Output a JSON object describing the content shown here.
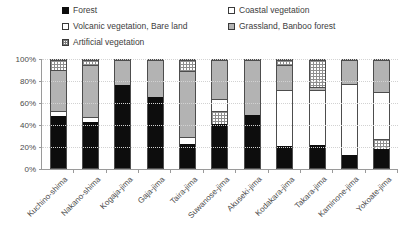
{
  "legend": {
    "left_items": [
      {
        "label": "Forest",
        "key": "forest",
        "color": "#0d0d0d"
      },
      {
        "label": "Volcanic vegetation, Bare land",
        "key": "volcanic",
        "color": "#ffffff"
      },
      {
        "label": "Artificial vegetation",
        "key": "artificial",
        "color": "#ffffff"
      }
    ],
    "right_items": [
      {
        "label": "Coastal vegetation",
        "key": "coastal",
        "color": "#ffffff"
      },
      {
        "label": "Grassland, Banboo forest",
        "key": "grassland",
        "color": "#b3b3b3"
      }
    ]
  },
  "axis": {
    "y_ticks": [
      "0%",
      "20%",
      "40%",
      "60%",
      "80%",
      "100%"
    ]
  },
  "chart_data": {
    "type": "bar",
    "title": "",
    "subtitle": "",
    "xlabel": "",
    "ylabel": "",
    "ylim": [
      0,
      100
    ],
    "ytick_labels": [
      "0%",
      "20%",
      "40%",
      "60%",
      "80%",
      "100%"
    ],
    "ytick_values": [
      0,
      20,
      40,
      60,
      80,
      100
    ],
    "grid": true,
    "stacked": true,
    "normalized_percent": true,
    "legend_position": "top",
    "categories": [
      "Kuchino-shima",
      "Nakano-shima",
      "Kogaja-jima",
      "Gaja-jima",
      "Taira-jima",
      "Suwanose-jima",
      "Akuseki-jima",
      "Kodakara-jima",
      "Takara-jima",
      "Kaminone-jima",
      "Yokoate-jima"
    ],
    "series": [
      {
        "name": "Forest",
        "color": "#0d0d0d",
        "pattern": "solid-black",
        "values": [
          48,
          43,
          77,
          66,
          22,
          41,
          49,
          20,
          21,
          12,
          18
        ]
      },
      {
        "name": "Volcanic vegetation, Bare land",
        "color": "#ffffff",
        "pattern": "white",
        "values": [
          0,
          0,
          0,
          0,
          0,
          0,
          0,
          0,
          0,
          0,
          0
        ]
      },
      {
        "name": "Artificial vegetation",
        "color": "#ffffff",
        "pattern": "fine-grid",
        "values": [
          0,
          0,
          0,
          0,
          0,
          12,
          0,
          0,
          0,
          0,
          9
        ]
      },
      {
        "name": "Coastal vegetation",
        "color": "#ffffff",
        "pattern": "white",
        "values": [
          5,
          4,
          0,
          0,
          7,
          11,
          0,
          52,
          51,
          66,
          43
        ]
      },
      {
        "name": "Grassland, Banboo forest",
        "color": "#b3b3b3",
        "pattern": "gray",
        "values": [
          38,
          48,
          23,
          34,
          61,
          36,
          51,
          23,
          3,
          22,
          30
        ]
      },
      {
        "name": "Artificial vegetation (top)",
        "color": "#ffffff",
        "pattern": "fine-grid",
        "values": [
          9,
          5,
          0,
          0,
          10,
          0,
          0,
          5,
          25,
          0,
          0
        ]
      }
    ],
    "stack_order_bottom_to_top": [
      "Forest",
      "Volcanic vegetation, Bare land",
      "Artificial vegetation",
      "Coastal vegetation",
      "Grassland, Banboo forest",
      "Artificial vegetation (top)"
    ],
    "bars": [
      {
        "category": "Kuchino-shima",
        "segments": [
          {
            "series": "Forest",
            "value": 48
          },
          {
            "series": "Coastal vegetation",
            "value": 5
          },
          {
            "series": "Grassland, Banboo forest",
            "value": 38
          },
          {
            "series": "Artificial vegetation",
            "value": 9
          }
        ]
      },
      {
        "category": "Nakano-shima",
        "segments": [
          {
            "series": "Forest",
            "value": 43
          },
          {
            "series": "Coastal vegetation",
            "value": 4
          },
          {
            "series": "Grassland, Banboo forest",
            "value": 48
          },
          {
            "series": "Artificial vegetation",
            "value": 5
          }
        ]
      },
      {
        "category": "Kogaja-jima",
        "segments": [
          {
            "series": "Forest",
            "value": 77
          },
          {
            "series": "Grassland, Banboo forest",
            "value": 23
          }
        ]
      },
      {
        "category": "Gaja-jima",
        "segments": [
          {
            "series": "Forest",
            "value": 66
          },
          {
            "series": "Grassland, Banboo forest",
            "value": 34
          }
        ]
      },
      {
        "category": "Taira-jima",
        "segments": [
          {
            "series": "Forest",
            "value": 22
          },
          {
            "series": "Coastal vegetation",
            "value": 7
          },
          {
            "series": "Grassland, Banboo forest",
            "value": 61
          },
          {
            "series": "Artificial vegetation",
            "value": 10
          }
        ]
      },
      {
        "category": "Suwanose-jima",
        "segments": [
          {
            "series": "Forest",
            "value": 41
          },
          {
            "series": "Artificial vegetation",
            "value": 12
          },
          {
            "series": "Coastal vegetation",
            "value": 11
          },
          {
            "series": "Grassland, Banboo forest",
            "value": 36
          }
        ]
      },
      {
        "category": "Akuseki-jima",
        "segments": [
          {
            "series": "Forest",
            "value": 49
          },
          {
            "series": "Grassland, Banboo forest",
            "value": 51
          }
        ]
      },
      {
        "category": "Kodakara-jima",
        "segments": [
          {
            "series": "Forest",
            "value": 20
          },
          {
            "series": "Coastal vegetation",
            "value": 52
          },
          {
            "series": "Grassland, Banboo forest",
            "value": 23
          },
          {
            "series": "Artificial vegetation",
            "value": 5
          }
        ]
      },
      {
        "category": "Takara-jima",
        "segments": [
          {
            "series": "Forest",
            "value": 21
          },
          {
            "series": "Coastal vegetation",
            "value": 51
          },
          {
            "series": "Grassland, Banboo forest",
            "value": 3
          },
          {
            "series": "Artificial vegetation",
            "value": 25
          }
        ]
      },
      {
        "category": "Kaminone-jima",
        "segments": [
          {
            "series": "Forest",
            "value": 12
          },
          {
            "series": "Coastal vegetation",
            "value": 66
          },
          {
            "series": "Grassland, Banboo forest",
            "value": 22
          }
        ]
      },
      {
        "category": "Yokoate-jima",
        "segments": [
          {
            "series": "Forest",
            "value": 18
          },
          {
            "series": "Artificial vegetation",
            "value": 9
          },
          {
            "series": "Coastal vegetation",
            "value": 43
          },
          {
            "series": "Grassland, Banboo forest",
            "value": 30
          }
        ]
      }
    ]
  }
}
